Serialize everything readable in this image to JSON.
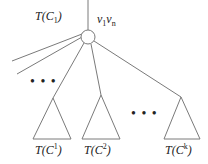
{
  "diagram": {
    "root": {
      "label": "T(C1)",
      "label_parts": {
        "T": "T",
        "C": "C",
        "sub": "1"
      },
      "node_label": {
        "v1": "v",
        "sub1": "1",
        "vn": "v",
        "subn": "n"
      }
    },
    "subtrees": [
      {
        "label_T": "T",
        "label_C": "C",
        "sup": "1"
      },
      {
        "label_T": "T",
        "label_C": "C",
        "sup": "2"
      },
      {
        "label_T": "T",
        "label_C": "C",
        "sup": "k"
      }
    ],
    "ellipsis_left": "• • •",
    "ellipsis_bottom": "• • •",
    "colors": {
      "stroke": "#7a7a7a",
      "text": "#222222"
    }
  }
}
